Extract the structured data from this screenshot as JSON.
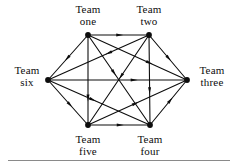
{
  "figure": {
    "background_color": "#ffffff",
    "ink_color": "#0d0d0d",
    "rule_color": "#8a8a8a"
  },
  "diagram": {
    "type": "directed-graph",
    "layout": "hexagon",
    "node_count": 6,
    "edge_count": 15,
    "nodes": [
      {
        "id": "one",
        "label_line1": "Team",
        "label_line2": "one",
        "x": 88,
        "y": 35,
        "label_position": "above"
      },
      {
        "id": "two",
        "label_line1": "Team",
        "label_line2": "two",
        "x": 149,
        "y": 35,
        "label_position": "above"
      },
      {
        "id": "three",
        "label_line1": "Team",
        "label_line2": "three",
        "x": 187,
        "y": 80,
        "label_position": "right"
      },
      {
        "id": "four",
        "label_line1": "Team",
        "label_line2": "four",
        "x": 150,
        "y": 125,
        "label_position": "below"
      },
      {
        "id": "five",
        "label_line1": "Team",
        "label_line2": "five",
        "x": 88,
        "y": 125,
        "label_position": "below"
      },
      {
        "id": "six",
        "label_line1": "Team",
        "label_line2": "six",
        "x": 48,
        "y": 80,
        "label_position": "left"
      }
    ],
    "edges": [
      {
        "from": "one",
        "to": "two",
        "arrow_at": 0.52
      },
      {
        "from": "one",
        "to": "six",
        "arrow_at": 0.52
      },
      {
        "from": "one",
        "to": "five",
        "arrow_at": 0.7
      },
      {
        "from": "one",
        "to": "four",
        "arrow_at": 0.42
      },
      {
        "from": "one",
        "to": "three",
        "arrow_at": 0.62
      },
      {
        "from": "two",
        "to": "three",
        "arrow_at": 0.52
      },
      {
        "from": "two",
        "to": "four",
        "arrow_at": 0.62
      },
      {
        "from": "two",
        "to": "five",
        "arrow_at": 0.46
      },
      {
        "from": "two",
        "to": "six",
        "arrow_at": 0.4
      },
      {
        "from": "six",
        "to": "three",
        "arrow_at": 0.62
      },
      {
        "from": "six",
        "to": "five",
        "arrow_at": 0.55
      },
      {
        "from": "six",
        "to": "four",
        "arrow_at": 0.44
      },
      {
        "from": "five",
        "to": "four",
        "arrow_at": 0.52
      },
      {
        "from": "five",
        "to": "three",
        "arrow_at": 0.48
      },
      {
        "from": "four",
        "to": "three",
        "arrow_at": 0.55
      }
    ]
  }
}
